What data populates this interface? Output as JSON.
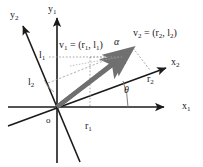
{
  "figure": {
    "type": "vector-coordinate-diagram",
    "background_color": "#ffffff",
    "axis_color": "#1a1a1a",
    "vector_color": "#6b6b6b",
    "guide_color": "#999999"
  },
  "labels": {
    "origin": "o",
    "axis_x1": "x",
    "axis_x1_sub": "1",
    "axis_y1": "y",
    "axis_y1_sub": "1",
    "axis_x2": "x",
    "axis_x2_sub": "2",
    "axis_y2": "y",
    "axis_y2_sub": "2",
    "component_r1": "r",
    "component_r1_sub": "1",
    "component_l1": "l",
    "component_l1_sub": "1",
    "component_r2": "r",
    "component_r2_sub": "2",
    "component_l2": "l",
    "component_l2_sub": "2",
    "angle_theta": "θ",
    "angle_alpha": "α",
    "vector1_equation": "v",
    "vector1_equation_sub": "1",
    "vector1_equation_rest": " = (r",
    "vector1_equation_sub2": "1",
    "vector1_equation_mid": ", l",
    "vector1_equation_sub3": "1",
    "vector1_equation_end": ")",
    "vector2_equation": "v",
    "vector2_equation_sub": "2",
    "vector2_equation_rest": " = (r",
    "vector2_equation_sub2": "2",
    "vector2_equation_mid": ", l",
    "vector2_equation_sub3": "2",
    "vector2_equation_end": ")"
  },
  "geometry": {
    "origin": {
      "x": 57,
      "y": 107
    },
    "axes": [
      {
        "name": "x1",
        "from": [
          8,
          107
        ],
        "to": [
          168,
          107
        ],
        "arrow_at_end": true
      },
      {
        "name": "y1",
        "from": [
          57,
          163
        ],
        "to": [
          57,
          14
        ],
        "arrow_at_end": true
      },
      {
        "name": "x2",
        "from": [
          8,
          130
        ],
        "to": [
          170,
          66
        ],
        "arrow_at_end": true
      },
      {
        "name": "y2",
        "from": [
          78,
          162
        ],
        "to": [
          20,
          22
        ],
        "arrow_at_end": true
      }
    ],
    "vectors": [
      {
        "name": "v1",
        "from": [
          57,
          107
        ],
        "to": [
          128,
          53
        ],
        "label_point": [
          88,
          44
        ]
      },
      {
        "name": "v2",
        "from": [
          57,
          107
        ],
        "to": [
          133,
          48
        ],
        "label_point": [
          156,
          37
        ]
      }
    ],
    "guides": [
      {
        "name": "l1-horizontal-dotted",
        "from": [
          48,
          57
        ],
        "to": [
          128,
          57
        ]
      },
      {
        "name": "r1-vertical-dotted",
        "from": [
          90,
          58
        ],
        "to": [
          90,
          107
        ]
      },
      {
        "name": "l2-diagonal-dashed",
        "from": [
          48,
          82
        ],
        "to": [
          130,
          50
        ]
      },
      {
        "name": "r2-perpendicular-dotted",
        "from": [
          133,
          48
        ],
        "to": [
          150,
          70
        ]
      }
    ],
    "angle_arcs": [
      {
        "name": "theta-arc",
        "center": [
          57,
          107
        ],
        "radius": 68,
        "label_point": [
          126,
          91
        ]
      },
      {
        "name": "alpha-arc",
        "center": [
          57,
          107
        ],
        "radius": 80,
        "label_point": [
          117,
          43
        ]
      }
    ]
  }
}
